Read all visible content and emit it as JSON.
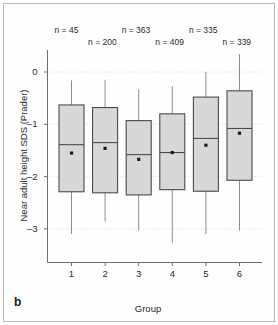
{
  "figure": {
    "panel_letter": "b",
    "background_color": "#ffffff",
    "border_color": "#b9b9b9"
  },
  "chart_data": {
    "type": "box",
    "title": "",
    "subtitle": "",
    "xlabel": "Group",
    "ylabel": "Near adult height SDS (Prader)",
    "categories": [
      "1",
      "2",
      "3",
      "4",
      "5",
      "6"
    ],
    "x_tick_labels": [
      "1",
      "2",
      "3",
      "4",
      "5",
      "6"
    ],
    "y_tick_labels": [
      "0",
      "–1",
      "–2",
      "–3"
    ],
    "y_ticks": [
      0,
      -1,
      -2,
      -3
    ],
    "ylim": [
      -3.35,
      0.55
    ],
    "grid": "horizontal-dotted",
    "legend": "none",
    "box_fill_color": "#d8d8d6",
    "box_edge_color": "#4a4a4a",
    "whisker_color": "#8c8c8c",
    "mean_marker": "square-dot",
    "mean_marker_color": "#1a1a1a",
    "annotations": [
      "n = 45",
      "n = 200",
      "n = 363",
      "n = 409",
      "n = 335",
      "n = 339"
    ],
    "boxes": [
      {
        "group": "1",
        "n_label": "n = 45",
        "n": 45,
        "whisker_high": -0.16,
        "q3": -0.63,
        "median": -1.39,
        "mean": -1.55,
        "q1": -2.29,
        "whisker_low": -3.1
      },
      {
        "group": "2",
        "n_label": "n = 200",
        "n": 200,
        "whisker_high": -0.15,
        "q3": -0.68,
        "median": -1.35,
        "mean": -1.46,
        "q1": -2.31,
        "whisker_low": -2.86
      },
      {
        "group": "3",
        "n_label": "n = 363",
        "n": 363,
        "whisker_high": -0.33,
        "q3": -0.93,
        "median": -1.58,
        "mean": -1.67,
        "q1": -2.35,
        "whisker_low": -3.03
      },
      {
        "group": "4",
        "n_label": "n = 409",
        "n": 409,
        "whisker_high": -0.27,
        "q3": -0.8,
        "median": -1.54,
        "mean": -1.54,
        "q1": -2.25,
        "whisker_low": -3.27
      },
      {
        "group": "5",
        "n_label": "n = 335",
        "n": 335,
        "whisker_high": 0.0,
        "q3": -0.48,
        "median": -1.27,
        "mean": -1.4,
        "q1": -2.28,
        "whisker_low": -3.1
      },
      {
        "group": "6",
        "n_label": "n = 339",
        "n": 339,
        "whisker_high": 0.34,
        "q3": -0.36,
        "median": -1.08,
        "mean": -1.17,
        "q1": -2.07,
        "whisker_low": -3.03
      }
    ]
  }
}
